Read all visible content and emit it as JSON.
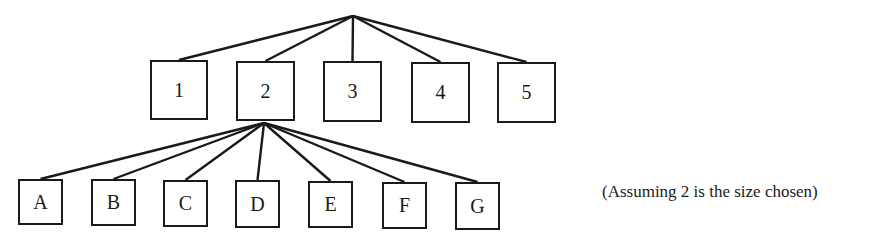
{
  "top_cut_text": ", ... ... ... ..y),",
  "root": {
    "x": 353,
    "y": 16
  },
  "level1": {
    "hub": {
      "x": 264,
      "y": 123
    },
    "nodes": [
      {
        "label": "1",
        "x": 150,
        "y": 60,
        "w": 58,
        "h": 60
      },
      {
        "label": "2",
        "x": 236,
        "y": 61,
        "w": 59,
        "h": 60
      },
      {
        "label": "3",
        "x": 323,
        "y": 61,
        "w": 59,
        "h": 61
      },
      {
        "label": "4",
        "x": 411,
        "y": 62,
        "w": 59,
        "h": 61
      },
      {
        "label": "5",
        "x": 497,
        "y": 62,
        "w": 59,
        "h": 61
      }
    ]
  },
  "level2": {
    "nodes": [
      {
        "label": "A",
        "x": 18,
        "y": 179,
        "w": 45,
        "h": 46
      },
      {
        "label": "B",
        "x": 91,
        "y": 179,
        "w": 45,
        "h": 47
      },
      {
        "label": "C",
        "x": 163,
        "y": 180,
        "w": 45,
        "h": 47
      },
      {
        "label": "D",
        "x": 235,
        "y": 180,
        "w": 45,
        "h": 48
      },
      {
        "label": "E",
        "x": 308,
        "y": 181,
        "w": 45,
        "h": 47
      },
      {
        "label": "F",
        "x": 382,
        "y": 182,
        "w": 45,
        "h": 47
      },
      {
        "label": "G",
        "x": 455,
        "y": 182,
        "w": 45,
        "h": 48
      }
    ]
  },
  "caption": "(Assuming 2 is the size chosen)"
}
